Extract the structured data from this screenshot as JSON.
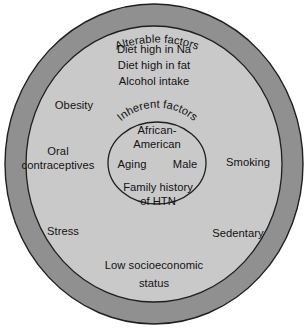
{
  "diagram": {
    "kind": "concentric-circle-venn",
    "title_outer_ring": "Alterable factors",
    "title_inner_circle": "Inherent factors",
    "colors": {
      "page_background": "#ffffff",
      "outer_ring_fill": "#909090",
      "middle_circle_fill": "#c9c9c9",
      "inner_circle_fill": "#c9c9c9",
      "outline": "#1c1c1c",
      "text": "#121212"
    },
    "rings": [
      {
        "name": "outer-ring",
        "label": "Alterable factors",
        "curved": true
      },
      {
        "name": "middle-circle",
        "label": "",
        "items": [
          {
            "name": "diet-high-in-na",
            "text": "Diet high in Na"
          },
          {
            "name": "diet-high-in-fat",
            "text": "Diet high in fat"
          },
          {
            "name": "alcohol-intake",
            "text": "Alcohol intake"
          },
          {
            "name": "obesity",
            "text": "Obesity"
          },
          {
            "name": "oral-contraceptives",
            "text": "Oral\ncontraceptives"
          },
          {
            "name": "smoking",
            "text": "Smoking"
          },
          {
            "name": "stress",
            "text": "Stress"
          },
          {
            "name": "sedentary",
            "text": "Sedentary"
          },
          {
            "name": "low-socioeconomic-status",
            "text": "Low socioeconomic\nstatus"
          }
        ]
      },
      {
        "name": "inner-circle",
        "label": "Inherent factors",
        "curved": true,
        "items": [
          {
            "name": "african-american",
            "text": "African-\nAmerican"
          },
          {
            "name": "aging",
            "text": "Aging"
          },
          {
            "name": "male",
            "text": "Male"
          },
          {
            "name": "family-history-of-htn",
            "text": "Family history\nof HTN"
          }
        ]
      }
    ],
    "labels": {
      "diet_na": "Diet high in Na",
      "diet_fat": "Diet high in fat",
      "alcohol": "Alcohol intake",
      "obesity": "Obesity",
      "oral_1": "Oral",
      "oral_2": "contraceptives",
      "smoking": "Smoking",
      "stress": "Stress",
      "sedentary": "Sedentary",
      "ses_1": "Low socioeconomic",
      "ses_2": "status",
      "african_1": "African-",
      "african_2": "American",
      "aging": "Aging",
      "male": "Male",
      "family_1": "Family history",
      "family_2": "of HTN"
    }
  }
}
